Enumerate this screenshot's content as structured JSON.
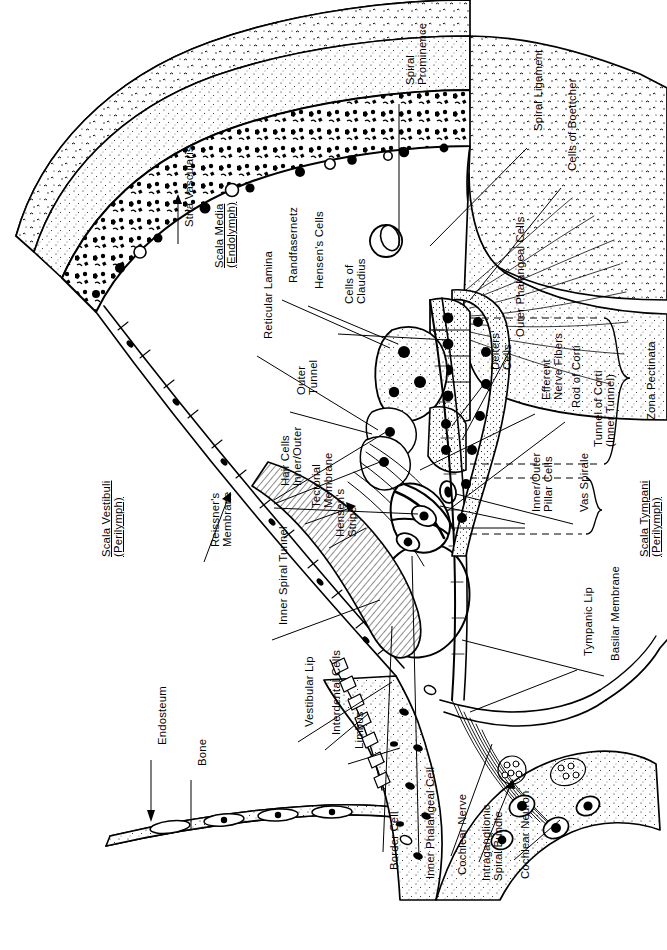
{
  "figure": {
    "orientation": "labels-rotated-90-ccw",
    "ink_color": "#000000",
    "background_color": "#ffffff"
  },
  "labels": [
    {
      "id": "spiral-prominence",
      "text": "Spiral\nProminence",
      "x": 404,
      "y": 85,
      "align": "left",
      "underline": false
    },
    {
      "id": "spiral-ligament",
      "text": "Spiral Ligament",
      "x": 532,
      "y": 131,
      "align": "left",
      "underline": false
    },
    {
      "id": "cells-of-boettcher",
      "text": "Cells of Boettcher",
      "x": 566,
      "y": 171,
      "align": "left",
      "underline": false
    },
    {
      "id": "stria-vascularis",
      "text": "Stria Vascularis",
      "x": 183,
      "y": 227,
      "align": "left",
      "underline": false
    },
    {
      "id": "scala-media",
      "text": "Scala Media\n(Endolymph)",
      "x": 213,
      "y": 268,
      "align": "left",
      "underline": true
    },
    {
      "id": "randfasernetz",
      "text": "Randfasernetz",
      "x": 287,
      "y": 283,
      "align": "left",
      "underline": false
    },
    {
      "id": "hensens-cells",
      "text": "Hensen's Cells",
      "x": 313,
      "y": 289,
      "align": "left",
      "underline": false
    },
    {
      "id": "cells-of-claudius",
      "text": "Cells of\nClaudius",
      "x": 343,
      "y": 304,
      "align": "left",
      "underline": false
    },
    {
      "id": "reticular-lamina",
      "text": "Reticular Lamina",
      "x": 262,
      "y": 339,
      "align": "left",
      "underline": false
    },
    {
      "id": "deiters-cells",
      "text": "Deiters'\nCells",
      "x": 489,
      "y": 370,
      "align": "left",
      "underline": false
    },
    {
      "id": "outer-phalangeal",
      "text": "Outer Phalangeal Cells",
      "x": 514,
      "y": 337,
      "align": "left",
      "underline": false
    },
    {
      "id": "outer-tunnel",
      "text": "Outer\nTunnel",
      "x": 295,
      "y": 395,
      "align": "left",
      "underline": false
    },
    {
      "id": "efferent-nerve",
      "text": "Efferent\nNerve Fibers",
      "x": 540,
      "y": 400,
      "align": "left",
      "underline": false
    },
    {
      "id": "rod-of-corti",
      "text": "Rod of Corti",
      "x": 570,
      "y": 408,
      "align": "left",
      "underline": false
    },
    {
      "id": "zona-pectinata",
      "text": "Zona Pectinata",
      "x": 645,
      "y": 420,
      "align": "left",
      "underline": false
    },
    {
      "id": "hair-cells",
      "text": "Hair Cells\nInner/Outer",
      "x": 279,
      "y": 486,
      "align": "left",
      "underline": false
    },
    {
      "id": "tunnel-of-corti",
      "text": "Tunnel of Corti\n(Inner Tunnel)",
      "x": 592,
      "y": 447,
      "align": "left",
      "underline": false
    },
    {
      "id": "tectorial-membrane",
      "text": "Tectorial\nMembrane",
      "x": 310,
      "y": 508,
      "align": "left",
      "underline": false
    },
    {
      "id": "inner-outer-pillar",
      "text": "Inner/Outer\nPillar Cells",
      "x": 530,
      "y": 512,
      "align": "left",
      "underline": false
    },
    {
      "id": "vas-spirale",
      "text": "Vas Spirale",
      "x": 578,
      "y": 512,
      "align": "left",
      "underline": false
    },
    {
      "id": "hensens-stripe",
      "text": "Hensen's\nStripe",
      "x": 334,
      "y": 537,
      "align": "left",
      "underline": false
    },
    {
      "id": "scala-vestibuli",
      "text": "Scala Vestibuli\n(Perilymph)",
      "x": 100,
      "y": 557,
      "align": "left",
      "underline": true
    },
    {
      "id": "reissners-membrane",
      "text": "Reissner's\nMembrane",
      "x": 209,
      "y": 547,
      "align": "left",
      "underline": false
    },
    {
      "id": "scala-tympani",
      "text": "Scala Tympani\n(Perilymph)",
      "x": 638,
      "y": 557,
      "align": "left",
      "underline": true
    },
    {
      "id": "inner-spiral-tunnel",
      "text": "Inner Spiral Tunnel",
      "x": 277,
      "y": 625,
      "align": "left",
      "underline": false
    },
    {
      "id": "tympanic-lip",
      "text": "Tympanic Lip",
      "x": 582,
      "y": 656,
      "align": "left",
      "underline": false
    },
    {
      "id": "basilar-membrane",
      "text": "Basilar Membrane",
      "x": 609,
      "y": 661,
      "align": "left",
      "underline": false
    },
    {
      "id": "endosteum",
      "text": "Endosteum",
      "x": 156,
      "y": 745,
      "align": "left",
      "underline": false
    },
    {
      "id": "bone",
      "text": "Bone",
      "x": 196,
      "y": 766,
      "align": "left",
      "underline": false
    },
    {
      "id": "vestibular-lip",
      "text": "Vestibular Lip",
      "x": 303,
      "y": 727,
      "align": "left",
      "underline": false
    },
    {
      "id": "interdental-cells",
      "text": "Interdental Cells",
      "x": 330,
      "y": 735,
      "align": "left",
      "underline": false
    },
    {
      "id": "limbus",
      "text": "Limbus",
      "x": 353,
      "y": 749,
      "align": "left",
      "underline": false
    },
    {
      "id": "border-cell",
      "text": "Border Cell",
      "x": 388,
      "y": 870,
      "align": "left",
      "underline": false
    },
    {
      "id": "inner-phalangeal",
      "text": "Inner Phalangeal Cell",
      "x": 424,
      "y": 879,
      "align": "left",
      "underline": false
    },
    {
      "id": "cochlear-nerve",
      "text": "Cochlear Nerve",
      "x": 456,
      "y": 875,
      "align": "left",
      "underline": false
    },
    {
      "id": "intraganglionic",
      "text": "Intraganglionic\nSpiral Bundle",
      "x": 480,
      "y": 881,
      "align": "left",
      "underline": false
    },
    {
      "id": "cochlear-neuron",
      "text": "Cochlear Neuron",
      "x": 519,
      "y": 879,
      "align": "left",
      "underline": false
    }
  ],
  "anatomy_regions": [
    "bone",
    "endosteum",
    "scala vestibuli",
    "scala media",
    "scala tympani",
    "stria vascularis",
    "spiral ligament",
    "spiral prominence",
    "organ of Corti",
    "basilar membrane",
    "limbus",
    "spiral ganglion"
  ]
}
